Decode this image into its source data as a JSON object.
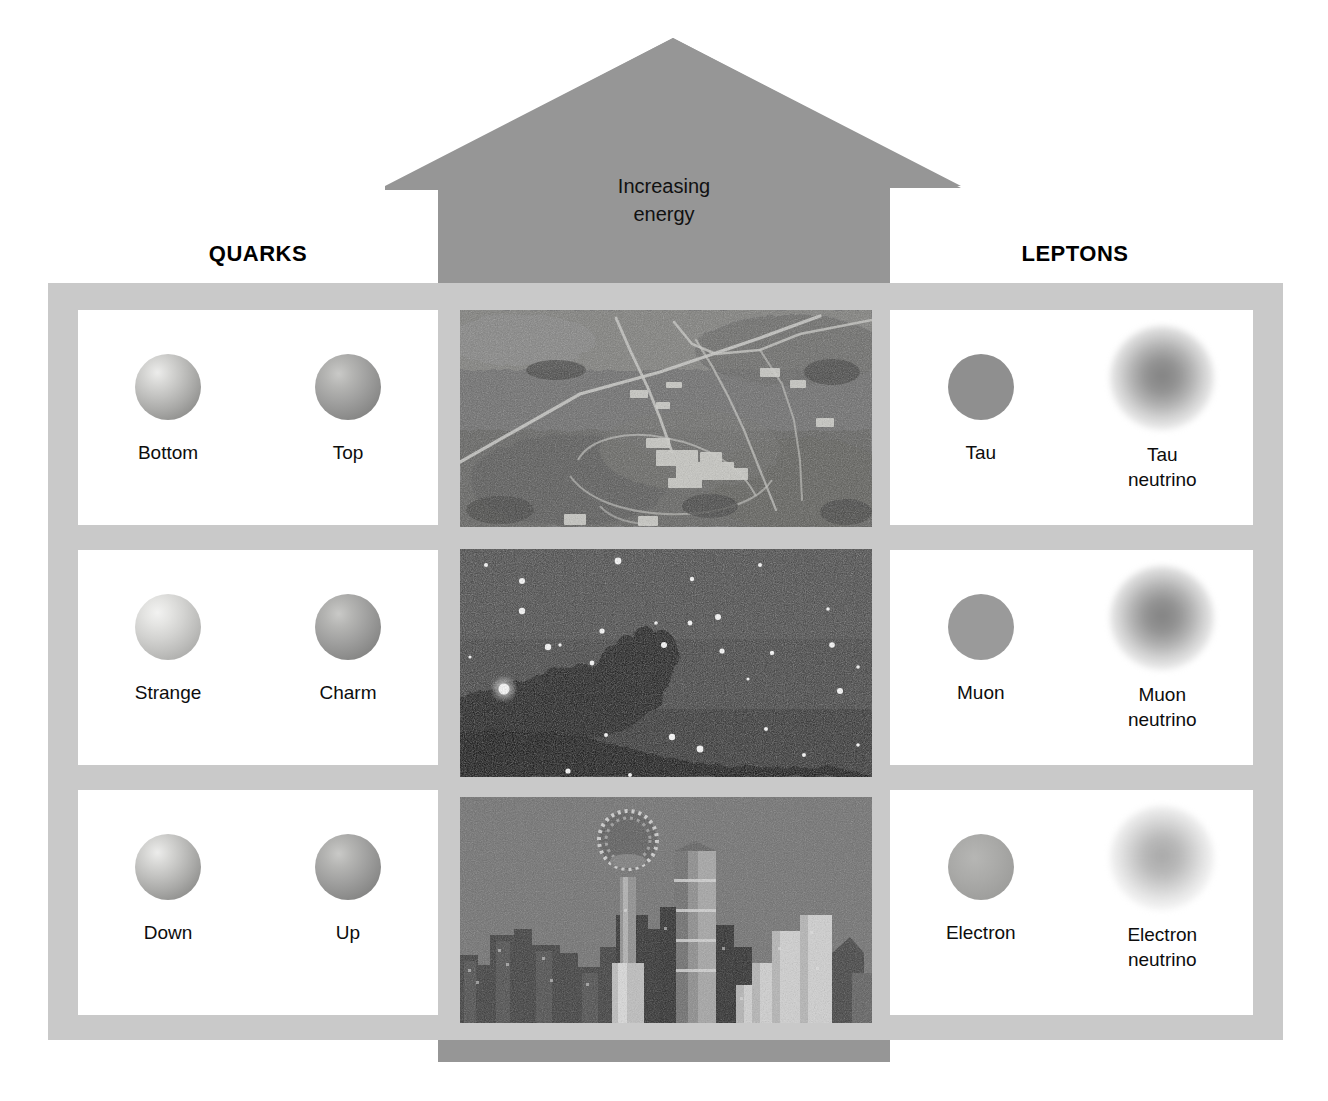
{
  "diagram": {
    "type": "standard-model-particle-chart",
    "arrow": {
      "label": "Increasing\nenergy",
      "direction": "up",
      "color": "#969696"
    },
    "frames": {
      "color": "#c9c9c9",
      "card_color": "#ffffff"
    },
    "groups": [
      {
        "id": "quarks",
        "title": "QUARKS",
        "side": "left",
        "rows": [
          {
            "generation": 3,
            "particles": [
              {
                "name": "Bottom",
                "symbol_style": "shaded-sphere",
                "render": "shaded"
              },
              {
                "name": "Top",
                "symbol_style": "shaded-sphere-dark",
                "render": "shaded-dark"
              }
            ]
          },
          {
            "generation": 2,
            "particles": [
              {
                "name": "Strange",
                "symbol_style": "shaded-sphere-light",
                "render": "shaded-light"
              },
              {
                "name": "Charm",
                "symbol_style": "shaded-sphere-dark",
                "render": "shaded-dark"
              }
            ]
          },
          {
            "generation": 1,
            "particles": [
              {
                "name": "Down",
                "symbol_style": "shaded-sphere",
                "render": "shaded"
              },
              {
                "name": "Up",
                "symbol_style": "shaded-sphere-dark",
                "render": "shaded-dark"
              }
            ]
          }
        ]
      },
      {
        "id": "leptons",
        "title": "LEPTONS",
        "side": "right",
        "rows": [
          {
            "generation": 3,
            "particles": [
              {
                "name": "Tau",
                "symbol_style": "flat-sphere",
                "render": "flat"
              },
              {
                "name": "Tau\nneutrino",
                "symbol_style": "fuzzy-cloud",
                "render": "fuzzy"
              }
            ]
          },
          {
            "generation": 2,
            "particles": [
              {
                "name": "Muon",
                "symbol_style": "flat-sphere",
                "render": "flat-mid"
              },
              {
                "name": "Muon\nneutrino",
                "symbol_style": "fuzzy-cloud",
                "render": "fuzzy"
              }
            ]
          },
          {
            "generation": 1,
            "particles": [
              {
                "name": "Electron",
                "symbol_style": "flat-sphere-soft",
                "render": "flat-soft"
              },
              {
                "name": "Electron\nneutrino",
                "symbol_style": "fuzzy-cloud-light",
                "render": "fuzzy-light"
              }
            ]
          }
        ]
      }
    ],
    "photos": [
      {
        "id": "aerial",
        "row": 3,
        "caption_visible": false,
        "description": "aerial-photograph-of-accelerator-laboratory-site-with-roads-and-buildings"
      },
      {
        "id": "nebula",
        "row": 2,
        "caption_visible": false,
        "description": "night-sky-star-field-with-dark-horsehead-nebula-silhouette"
      },
      {
        "id": "skyline",
        "row": 1,
        "caption_visible": false,
        "description": "city-skyline-at-dusk-with-ball-topped-observation-tower-and-skyscrapers"
      }
    ]
  },
  "colors": {
    "background": "#ffffff",
    "arrow_gray": "#969696",
    "frame_gray": "#c9c9c9",
    "text_black": "#0d0d0d"
  }
}
